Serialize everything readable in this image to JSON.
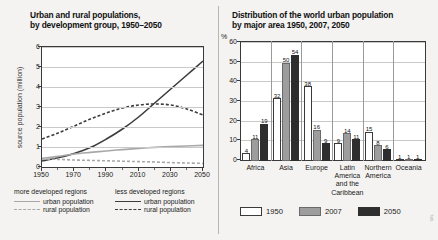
{
  "left": {
    "title": "Urban and rural populations,\nby development group, 1950-2050",
    "title_line1": "Urban and rural populations,",
    "title_line2": "by development group, 1950–2050",
    "ylabel": "source population (million)",
    "yticks": [
      "0",
      "1",
      "2",
      "3",
      "4",
      "5",
      "6"
    ],
    "xticks": [
      "1950",
      "1970",
      "1990",
      "2010",
      "2030",
      "2050"
    ],
    "legend": {
      "col1_head": "more developed regions",
      "col1_items": [
        "urban population",
        "rural population"
      ],
      "col2_head": "less developed regions",
      "col2_items": [
        "urban population",
        "rural population"
      ]
    }
  },
  "right": {
    "title_line1": "Distribution of the world urban population",
    "title_line2": "by major area 1950, 2007, 2050",
    "unit": "%",
    "yticks": [
      "0",
      "10",
      "20",
      "30",
      "40",
      "50",
      "60"
    ],
    "legend": [
      "1950",
      "2007",
      "2050"
    ]
  },
  "watermark": "785",
  "colors": {
    "bar_1950": "#ffffff",
    "bar_2007": "#9d9d9d",
    "bar_2050": "#2e2e2e",
    "line_more_developed": "#a8a8a8",
    "line_less_developed": "#3d3d3d",
    "page_bg": "#f4f3f1",
    "plot_bg": "#ffffff"
  },
  "chart_data": [
    {
      "type": "line",
      "title": "Urban and rural populations, by development group, 1950-2050",
      "xlabel": "",
      "ylabel": "source population (million)",
      "xlim": [
        1950,
        2050
      ],
      "ylim": [
        0,
        6
      ],
      "grid": true,
      "legend_position": "below",
      "x": [
        1950,
        1960,
        1970,
        1980,
        1990,
        2000,
        2010,
        2020,
        2030,
        2040,
        2050
      ],
      "series": [
        {
          "name": "less developed regions - urban population",
          "style": "solid",
          "color": "#3d3d3d",
          "values": [
            0.3,
            0.46,
            0.68,
            0.97,
            1.4,
            1.9,
            2.5,
            3.2,
            3.9,
            4.6,
            5.3
          ]
        },
        {
          "name": "less developed regions - rural population",
          "style": "dashed",
          "color": "#3d3d3d",
          "values": [
            1.4,
            1.7,
            2.05,
            2.4,
            2.7,
            2.95,
            3.1,
            3.15,
            3.1,
            2.9,
            2.6
          ]
        },
        {
          "name": "more developed regions - urban population",
          "style": "solid",
          "color": "#a8a8a8",
          "values": [
            0.43,
            0.53,
            0.65,
            0.73,
            0.8,
            0.87,
            0.93,
            0.98,
            1.02,
            1.05,
            1.08
          ]
        },
        {
          "name": "more developed regions - rural population",
          "style": "dashed",
          "color": "#a8a8a8",
          "values": [
            0.4,
            0.38,
            0.35,
            0.33,
            0.31,
            0.29,
            0.27,
            0.25,
            0.22,
            0.2,
            0.18
          ]
        }
      ]
    },
    {
      "type": "bar",
      "title": "Distribution of the world urban population by major area 1950, 2007, 2050",
      "xlabel": "",
      "ylabel": "%",
      "ylim": [
        0,
        60
      ],
      "grid": true,
      "legend_position": "below",
      "categories": [
        "Africa",
        "Asia",
        "Europe",
        "Latin America and the Caribbean",
        "Northern America",
        "Oceania"
      ],
      "category_labels": [
        [
          "Africa"
        ],
        [
          "Asia"
        ],
        [
          "Europe"
        ],
        [
          "Latin",
          "America",
          "and the",
          "Caribbean"
        ],
        [
          "Northern",
          "America"
        ],
        [
          "Oceania"
        ]
      ],
      "series": [
        {
          "name": "1950",
          "color": "#ffffff",
          "values": [
            4,
            32,
            38,
            9,
            15,
            1
          ]
        },
        {
          "name": "2007",
          "color": "#9d9d9d",
          "values": [
            11,
            50,
            16,
            14,
            8,
            1
          ]
        },
        {
          "name": "2050",
          "color": "#2e2e2e",
          "values": [
            19,
            54,
            9,
            11,
            6,
            1
          ]
        }
      ]
    }
  ]
}
